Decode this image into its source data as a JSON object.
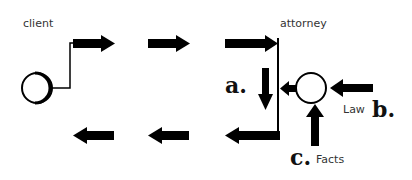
{
  "labels": {
    "client": "client",
    "attorney": "attorney",
    "law": "Law",
    "facts": "Facts",
    "a": "a.",
    "b": "b.",
    "c": "c."
  },
  "colors": {
    "stroke": "#000000",
    "background": "#ffffff",
    "text": "#333333"
  }
}
